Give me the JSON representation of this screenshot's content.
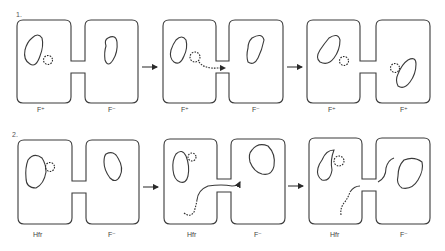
{
  "diagram": {
    "rows": [
      {
        "number": "1.",
        "panels": [
          {
            "left_label": "F⁺",
            "right_label": "F⁻"
          },
          {
            "left_label": "F⁺",
            "right_label": "F⁻"
          },
          {
            "left_label": "F⁺",
            "right_label": "F⁺"
          }
        ]
      },
      {
        "number": "2.",
        "panels": [
          {
            "left_label": "Hfr",
            "right_label": "F⁻"
          },
          {
            "left_label": "Hfr",
            "right_label": "F⁻"
          },
          {
            "left_label": "Hfr",
            "right_label": "F⁻"
          }
        ]
      }
    ],
    "stroke_color": "#3a3a3a",
    "background": "#ffffff"
  }
}
